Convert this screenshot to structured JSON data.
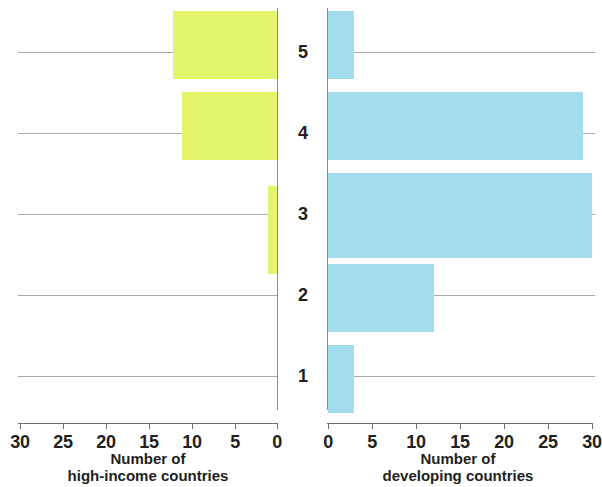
{
  "chart_data": {
    "type": "bar",
    "orientation": "horizontal",
    "layout": "butterfly-pyramid-two-panels",
    "title": "",
    "subtitle": "",
    "categories": [
      "5",
      "4",
      "3",
      "2",
      "1"
    ],
    "category_order_top_to_bottom": [
      "5",
      "4",
      "3",
      "2",
      "1"
    ],
    "grid": true,
    "legend": null,
    "panels": [
      {
        "id": "left",
        "side": "left",
        "series_name": "high-income countries",
        "xlabel_lines": [
          "Number of",
          "high-income countries"
        ],
        "ylabel": "",
        "color": "#e5f56b",
        "direction": "right-to-left",
        "xlim": [
          30,
          0
        ],
        "ticks": [
          30,
          25,
          20,
          15,
          10,
          5,
          0
        ],
        "tick_labels": [
          "30",
          "25",
          "20",
          "15",
          "10",
          "5",
          "0"
        ],
        "values_top_to_bottom": [
          12,
          11,
          1,
          0,
          0
        ],
        "bars": [
          {
            "category": "5",
            "value": 12
          },
          {
            "category": "4",
            "value": 11
          },
          {
            "category": "3",
            "value": 1
          },
          {
            "category": "2",
            "value": 0
          },
          {
            "category": "1",
            "value": 0
          }
        ]
      },
      {
        "id": "right",
        "side": "right",
        "series_name": "developing countries",
        "xlabel_lines": [
          "Number of",
          "developing countries"
        ],
        "ylabel": "",
        "color": "#a2dced",
        "direction": "left-to-right",
        "xlim": [
          0,
          30
        ],
        "ticks": [
          0,
          5,
          10,
          15,
          20,
          25,
          30
        ],
        "tick_labels": [
          "0",
          "5",
          "10",
          "15",
          "20",
          "25",
          "30"
        ],
        "values_top_to_bottom": [
          3,
          29,
          30,
          12,
          3
        ],
        "bars": [
          {
            "category": "5",
            "value": 3
          },
          {
            "category": "4",
            "value": 29
          },
          {
            "category": "3",
            "value": 30
          },
          {
            "category": "2",
            "value": 12
          },
          {
            "category": "1",
            "value": 3
          }
        ]
      }
    ],
    "colors": {
      "high_income": "#e5f56b",
      "developing": "#a2dced",
      "grid": "#8e8e8e",
      "axis": "#6f6f6f",
      "text": "#231f20",
      "background": "#ffffff"
    }
  }
}
